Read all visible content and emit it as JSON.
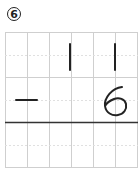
{
  "problem": {
    "number": "6",
    "top_digits": [
      "",
      "",
      "",
      "1",
      "",
      "1"
    ],
    "operator": "−",
    "bottom_digit": "6",
    "grid": {
      "columns": 6,
      "rows": 6
    },
    "colors": {
      "grid": "#c8c8c8",
      "line": "#333333",
      "ink": "#222222"
    }
  }
}
